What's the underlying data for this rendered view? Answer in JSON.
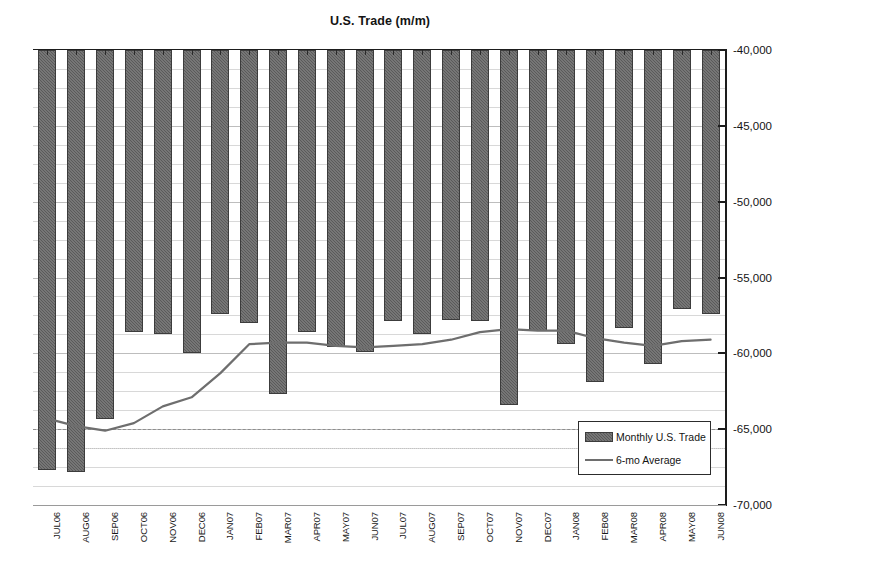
{
  "chart_data": {
    "type": "bar",
    "title": "U.S. Trade (m/m)",
    "xlabel": "",
    "ylabel": "",
    "ylim": [
      -70000,
      -40000
    ],
    "ytick_values": [
      -40000,
      -45000,
      -50000,
      -55000,
      -60000,
      -65000,
      -70000
    ],
    "ytick_labels": [
      "-40,000",
      "-45,000",
      "-50,000",
      "-55,000",
      "-60,000",
      "-65,000",
      "-70,000"
    ],
    "grid": true,
    "legend_position": "inside-bottom-right",
    "categories": [
      "JUL06",
      "AUG06",
      "SEP06",
      "OCT06",
      "NOV06",
      "DEC06",
      "JAN07",
      "FEB07",
      "MAR07",
      "APR07",
      "MAY07",
      "JUN07",
      "JUL07",
      "AUG07",
      "SEP07",
      "OCT07",
      "NOV07",
      "DEC07",
      "JAN08",
      "FEB08",
      "MAR08",
      "APR08",
      "MAY08",
      "JUN08"
    ],
    "series": [
      {
        "name": "Monthly U.S. Trade",
        "type": "bar",
        "color": "#5a5a5a",
        "values": [
          -67700,
          -67800,
          -64300,
          -58600,
          -58700,
          -60000,
          -57400,
          -58000,
          -62700,
          -58600,
          -59600,
          -59900,
          -57900,
          -58700,
          -57800,
          -57900,
          -63400,
          -58500,
          -59400,
          -61900,
          -58300,
          -60700,
          -57100,
          -57400
        ]
      },
      {
        "name": "6-mo Average",
        "type": "line",
        "color": "#6e6e6e",
        "values": [
          -64300,
          -64800,
          -65100,
          -64600,
          -63500,
          -62900,
          -61300,
          -59400,
          -59300,
          -59300,
          -59500,
          -59600,
          -59500,
          -59400,
          -59100,
          -58600,
          -58400,
          -58500,
          -58500,
          -59000,
          -59300,
          -59500,
          -59200,
          -59100
        ]
      }
    ]
  },
  "legend": {
    "items": [
      {
        "label": "Monthly U.S. Trade",
        "swatch": "bar-swatch"
      },
      {
        "label": "6-mo Average",
        "swatch": "line-swatch"
      }
    ]
  }
}
